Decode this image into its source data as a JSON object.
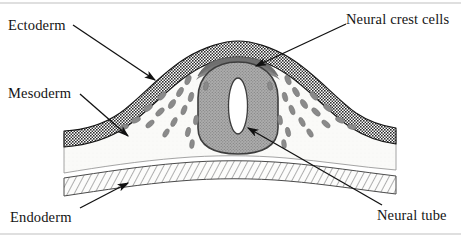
{
  "figure": {
    "background_color": "#ffffff",
    "width": 461,
    "height": 237
  },
  "labels": {
    "ectoderm": "Ectoderm",
    "mesoderm": "Mesoderm",
    "endoderm": "Endoderm",
    "neural_crest_cells": "Neural crest cells",
    "neural_tube": "Neural tube"
  },
  "structures": [
    {
      "name": "ectoderm",
      "label": "Ectoderm",
      "fill_pattern": "fine-checkerboard-grid",
      "fill_color": "#3a3a3a",
      "stroke_color": "#1a1a1a",
      "position": "outer arched surface layer"
    },
    {
      "name": "mesoderm",
      "label": "Mesoderm",
      "fill_pattern": "solid-pale",
      "fill_color": "#f7f7f5",
      "stroke_color": "#555555",
      "position": "middle layer between ectoderm and endoderm"
    },
    {
      "name": "endoderm",
      "label": "Endoderm",
      "fill_pattern": "diagonal-hatching",
      "fill_color": "#fbfbfa",
      "stroke_color": "#4a4a4a",
      "position": "lower horizontal band"
    },
    {
      "name": "neural-tube",
      "label": "Neural tube",
      "fill_pattern": "stippled-gray",
      "fill_color": "#9e9e9e",
      "stroke_color": "#3a3a3a",
      "lumen_color": "#ffffff",
      "position": "central rounded tube with white oval lumen"
    },
    {
      "name": "neural-crest-cells",
      "label": "Neural crest cells",
      "fill_pattern": "solid-gray-teardrops",
      "fill_color": "#8a8a8a",
      "stroke_color": "#6e6e6e",
      "position": "dark cap above neural tube plus scattered migrating cells"
    }
  ],
  "leader_lines": [
    {
      "name": "ectoderm-leader",
      "from_label": "Ectoderm",
      "points_to": "ectoderm layer, left flank"
    },
    {
      "name": "mesoderm-leader",
      "from_label": "Mesoderm",
      "points_to": "mesoderm layer, left flank"
    },
    {
      "name": "endoderm-leader",
      "from_label": "Endoderm",
      "points_to": "endoderm hatched band"
    },
    {
      "name": "crest-leader",
      "from_label": "Neural crest cells",
      "points_to": "neural crest cell mass at dorsal midline"
    },
    {
      "name": "tube-leader",
      "from_label": "Neural tube",
      "points_to": "neural tube wall"
    }
  ],
  "colors": {
    "ink": "#141414",
    "ectoderm_dark": "#3a3a3a",
    "neural_tube_gray": "#9e9e9e",
    "crest_gray": "#8a8a8a",
    "crest_cap_gray": "#737373",
    "mesoderm_pale": "#f7f7f5",
    "page_border": "#d4d4d4"
  }
}
